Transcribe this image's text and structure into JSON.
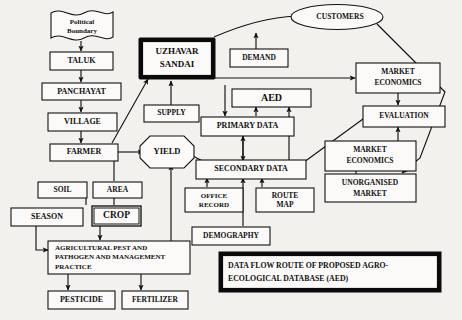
{
  "figure": {
    "caption": "DATA FLOW ROUTE OF PROPOSED AGRO-ECOLOGICAL DATABASE (AED)",
    "caption_line1": "DATA   FLOW   ROUTE   OF   PROPOSED   AGRO-",
    "caption_line2": "ECOLOGICAL DATABASE (AED)"
  },
  "nodes": {
    "political_boundary": {
      "label_line1": "Political",
      "label_line2": "Boundary",
      "shape": "wavy-flag"
    },
    "taluk": {
      "label": "TALUK",
      "shape": "rect"
    },
    "panchayat": {
      "label": "PANCHAYAT",
      "shape": "rect"
    },
    "village": {
      "label": "VILLAGE",
      "shape": "rect"
    },
    "farmer": {
      "label": "FARMER",
      "shape": "rect"
    },
    "soil": {
      "label": "SOIL",
      "shape": "rect"
    },
    "area": {
      "label": "AREA",
      "shape": "rect"
    },
    "crop": {
      "label": "CROP",
      "shape": "rect-double"
    },
    "season": {
      "label": "SEASON",
      "shape": "rect"
    },
    "practice": {
      "label_line1": "AGRICULTURAL PEST AND",
      "label_line2": "PATHOGEN AND MANAGEMENT",
      "label_line3": "PRACTICE",
      "shape": "rect"
    },
    "pesticide": {
      "label": "PESTICIDE",
      "shape": "rect"
    },
    "fertilizer": {
      "label": "FERTILIZER",
      "shape": "rect"
    },
    "uzhavar_sandai": {
      "label_line1": "UZHAVAR",
      "label_line2": "SANDAI",
      "shape": "rect-heavy"
    },
    "supply": {
      "label": "SUPPLY",
      "shape": "rect"
    },
    "yield": {
      "label": "YIELD",
      "shape": "octagon"
    },
    "demand": {
      "label": "DEMAND",
      "shape": "rect"
    },
    "aed": {
      "label": "AED",
      "shape": "rect"
    },
    "primary_data": {
      "label": "PRIMARY DATA",
      "shape": "rect"
    },
    "secondary_data": {
      "label": "SECONDARY DATA",
      "shape": "rect"
    },
    "office_record": {
      "label_line1": "OFFICE",
      "label_line2": "RECORD",
      "shape": "rect"
    },
    "route_map": {
      "label_line1": "ROUTE",
      "label_line2": "MAP",
      "shape": "rect"
    },
    "demography": {
      "label": "DEMOGRAPHY",
      "shape": "rect"
    },
    "customers": {
      "label": "CUSTOMERS",
      "shape": "ellipse"
    },
    "market_economics_top": {
      "label_line1": "MARKET",
      "label_line2": "ECONOMICS",
      "shape": "rect"
    },
    "evaluation": {
      "label": "EVALUATION",
      "shape": "rect"
    },
    "market_economics_bottom": {
      "label_line1": "MARKET",
      "label_line2": "ECONOMICS",
      "shape": "rect"
    },
    "unorganised_market": {
      "label_line1": "UNORGANISED",
      "label_line2": "MARKET",
      "shape": "rect"
    }
  },
  "colors": {
    "background": "#f2f1ee",
    "node_fill": "#fbfaf8",
    "stroke": "#121212",
    "heavy_stroke": "#0a0a0a"
  }
}
